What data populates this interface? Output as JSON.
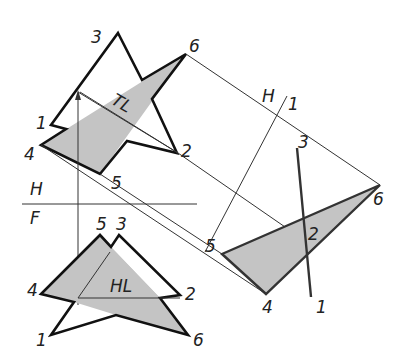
{
  "diagram": {
    "type": "descriptive-geometry auxiliary view",
    "fold_lines": {
      "hf": {
        "top_label": "H",
        "bottom_label": "F"
      },
      "h1": {
        "left_label": "H",
        "right_label": "1"
      }
    },
    "true_length_label": "TL",
    "horizontal_line_label": "HL",
    "top_view": {
      "vertex_labels": {
        "p1": "1",
        "p2": "2",
        "p3": "3",
        "p4": "4",
        "p5": "5",
        "p6": "6"
      }
    },
    "front_view": {
      "vertex_labels": {
        "p1": "1",
        "p2": "2",
        "p3": "3",
        "p4": "4",
        "p5": "5",
        "p6": "6"
      }
    },
    "auxiliary_view": {
      "vertex_labels": {
        "p1": "1",
        "p2": "2",
        "p3": "3",
        "p4": "4",
        "p5": "5",
        "p6": "6"
      }
    },
    "colors": {
      "shade": "#c4c4c4",
      "line": "#111111"
    }
  }
}
